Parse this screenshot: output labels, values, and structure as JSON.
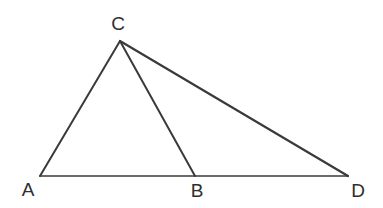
{
  "figure": {
    "kind": "geometry-diagram",
    "background_color": "#ffffff",
    "stroke_color": "#3a3a3a",
    "label_color": "#2e2e2e",
    "canvas": {
      "width": 383,
      "height": 208
    }
  },
  "points": [
    {
      "id": "A",
      "label": "A",
      "x": 40,
      "y": 176,
      "label_x": 28,
      "label_y": 189
    },
    {
      "id": "B",
      "label": "B",
      "x": 195,
      "y": 176,
      "label_x": 197,
      "label_y": 190
    },
    {
      "id": "C",
      "label": "C",
      "x": 120,
      "y": 41,
      "label_x": 118,
      "label_y": 23
    },
    {
      "id": "D",
      "label": "D",
      "x": 348,
      "y": 176,
      "label_x": 358,
      "label_y": 190
    }
  ],
  "segments": [
    {
      "id": "AD",
      "name": "segment-a-d",
      "x1": 40,
      "y1": 176,
      "x2": 348,
      "y2": 176,
      "width": 1.6
    },
    {
      "id": "AC",
      "name": "segment-a-c",
      "x1": 40,
      "y1": 176,
      "x2": 120,
      "y2": 41,
      "width": 2.0
    },
    {
      "id": "CB",
      "name": "segment-c-b",
      "x1": 120,
      "y1": 41,
      "x2": 195,
      "y2": 176,
      "width": 2.0
    },
    {
      "id": "CD",
      "name": "segment-c-d",
      "x1": 120,
      "y1": 41,
      "x2": 348,
      "y2": 176,
      "width": 2.2
    }
  ]
}
